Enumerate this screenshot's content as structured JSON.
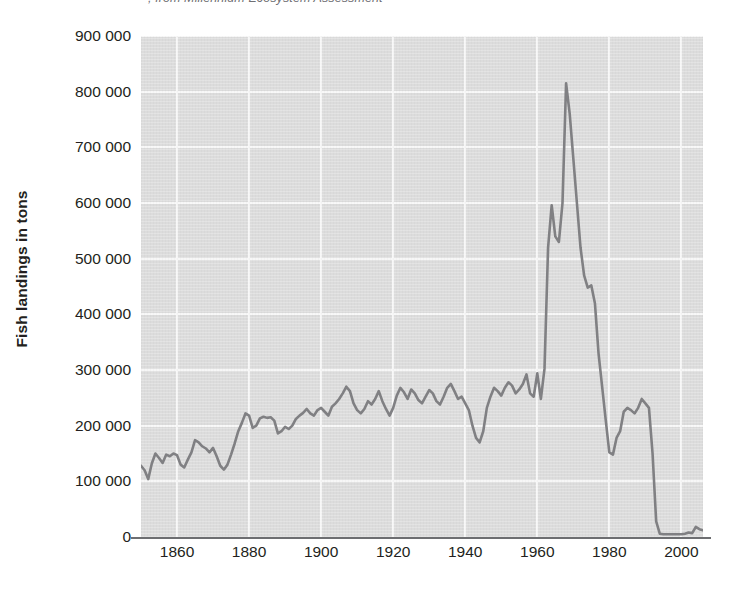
{
  "caption": {
    "text": "; from Millennium Ecosystem Assessment"
  },
  "chart_data": {
    "type": "line",
    "title": "",
    "subtitle": "",
    "xlabel": "",
    "ylabel": "Fish landings in tons",
    "xlim": [
      1850,
      2006
    ],
    "ylim": [
      0,
      900000
    ],
    "grid": true,
    "legend": null,
    "legend_position": "none",
    "plot_background_color": "#dcdcdc",
    "gridline_color": "#f7f7f7",
    "line_color": "#808083",
    "axis_color": "#6d6e71",
    "text_color": "#231f20",
    "y_ticks": [
      {
        "value": 900000,
        "label": "900 000"
      },
      {
        "value": 800000,
        "label": "800 000"
      },
      {
        "value": 700000,
        "label": "700 000"
      },
      {
        "value": 600000,
        "label": "600 000"
      },
      {
        "value": 500000,
        "label": "500 000"
      },
      {
        "value": 400000,
        "label": "400 000"
      },
      {
        "value": 300000,
        "label": "300 000"
      },
      {
        "value": 200000,
        "label": "200 000"
      },
      {
        "value": 100000,
        "label": "100 000"
      },
      {
        "value": 0,
        "label": "0"
      }
    ],
    "x_ticks": [
      {
        "value": 1860,
        "label": "1860"
      },
      {
        "value": 1880,
        "label": "1880"
      },
      {
        "value": 1900,
        "label": "1900"
      },
      {
        "value": 1920,
        "label": "1920"
      },
      {
        "value": 1940,
        "label": "1940"
      },
      {
        "value": 1960,
        "label": "1960"
      },
      {
        "value": 1980,
        "label": "1980"
      },
      {
        "value": 2000,
        "label": "2000"
      }
    ],
    "series": [
      {
        "name": "Fish landings",
        "x": [
          1850,
          1851,
          1852,
          1853,
          1854,
          1855,
          1856,
          1857,
          1858,
          1859,
          1860,
          1861,
          1862,
          1863,
          1864,
          1865,
          1866,
          1867,
          1868,
          1869,
          1870,
          1871,
          1872,
          1873,
          1874,
          1875,
          1876,
          1877,
          1878,
          1879,
          1880,
          1881,
          1882,
          1883,
          1884,
          1885,
          1886,
          1887,
          1888,
          1889,
          1890,
          1891,
          1892,
          1893,
          1894,
          1895,
          1896,
          1897,
          1898,
          1899,
          1900,
          1901,
          1902,
          1903,
          1904,
          1905,
          1906,
          1907,
          1908,
          1909,
          1910,
          1911,
          1912,
          1913,
          1914,
          1915,
          1916,
          1917,
          1918,
          1919,
          1920,
          1921,
          1922,
          1923,
          1924,
          1925,
          1926,
          1927,
          1928,
          1929,
          1930,
          1931,
          1932,
          1933,
          1934,
          1935,
          1936,
          1937,
          1938,
          1939,
          1940,
          1941,
          1942,
          1943,
          1944,
          1945,
          1946,
          1947,
          1948,
          1949,
          1950,
          1951,
          1952,
          1953,
          1954,
          1955,
          1956,
          1957,
          1958,
          1959,
          1960,
          1961,
          1962,
          1963,
          1964,
          1965,
          1966,
          1967,
          1968,
          1969,
          1970,
          1971,
          1972,
          1973,
          1974,
          1975,
          1976,
          1977,
          1978,
          1979,
          1980,
          1981,
          1982,
          1983,
          1984,
          1985,
          1986,
          1987,
          1988,
          1989,
          1990,
          1991,
          1992,
          1993,
          1994,
          1995,
          1996,
          1997,
          1998,
          1999,
          2000,
          2001,
          2002,
          2003,
          2004,
          2005,
          2006
        ],
        "values": [
          128000,
          120000,
          104000,
          132000,
          150000,
          142000,
          133000,
          148000,
          145000,
          150000,
          147000,
          130000,
          125000,
          139000,
          152000,
          174000,
          170000,
          163000,
          159000,
          152000,
          160000,
          145000,
          128000,
          121000,
          130000,
          148000,
          168000,
          190000,
          205000,
          222000,
          218000,
          196000,
          200000,
          213000,
          216000,
          214000,
          215000,
          209000,
          186000,
          190000,
          198000,
          194000,
          200000,
          212000,
          218000,
          223000,
          230000,
          222000,
          218000,
          228000,
          232000,
          225000,
          218000,
          234000,
          240000,
          248000,
          258000,
          270000,
          262000,
          240000,
          228000,
          222000,
          230000,
          244000,
          238000,
          248000,
          262000,
          244000,
          230000,
          218000,
          232000,
          254000,
          268000,
          260000,
          248000,
          265000,
          258000,
          246000,
          240000,
          252000,
          264000,
          258000,
          244000,
          238000,
          252000,
          268000,
          275000,
          262000,
          248000,
          252000,
          240000,
          228000,
          200000,
          178000,
          170000,
          190000,
          232000,
          252000,
          268000,
          262000,
          254000,
          268000,
          278000,
          272000,
          258000,
          265000,
          275000,
          292000,
          258000,
          252000,
          294000,
          248000,
          302000,
          520000,
          596000,
          540000,
          530000,
          600000,
          815000,
          760000,
          680000,
          600000,
          520000,
          470000,
          448000,
          452000,
          420000,
          330000,
          270000,
          210000,
          152000,
          148000,
          178000,
          190000,
          225000,
          232000,
          228000,
          222000,
          232000,
          248000,
          240000,
          232000,
          150000,
          28000,
          6000,
          5000,
          5000,
          5000,
          5000,
          5000,
          5000,
          6000,
          8000,
          7000,
          18000,
          14000,
          12000
        ]
      }
    ]
  }
}
